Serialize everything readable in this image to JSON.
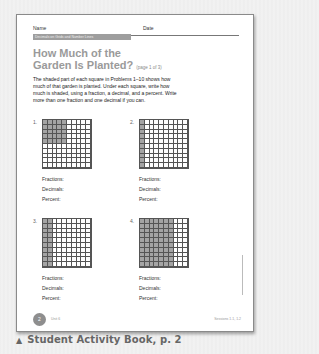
{
  "worksheet": {
    "name_label": "Name",
    "date_label": "Date",
    "banner": "Decimals on Grids and Number Lines",
    "title_line1": "How Much of the",
    "title_line2": "Garden Is Planted?",
    "page_indicator": "(page 1 of 3)",
    "instructions": "The shaded part of each square in Problems 1–10 shows how much of that garden is planted. Under each square, write how much is shaded, using a fraction, a decimal, and a percent. Write more than one fraction and one decimal if you can.",
    "problems": [
      {
        "number": "1.",
        "shading": "5x5 block top-left",
        "shaded_cells": 25,
        "labels": [
          "Fractions:",
          "Decimals:",
          "Percent:"
        ]
      },
      {
        "number": "2.",
        "shading": "first column",
        "shaded_cells": 10,
        "labels": [
          "Fractions:",
          "Decimals:",
          "Percent:"
        ]
      },
      {
        "number": "3.",
        "shading": "first two columns",
        "shaded_cells": 20,
        "labels": [
          "Fractions:",
          "Decimals:",
          "Percent:"
        ]
      },
      {
        "number": "4.",
        "shading": "first seven columns",
        "shaded_cells": 70,
        "labels": [
          "Fractions:",
          "Decimals:",
          "Percent:"
        ]
      }
    ],
    "footer": {
      "page_number": "2",
      "unit": "Unit 6",
      "sessions": "Sessions 1.1, 1.2",
      "copyright": "© Pearson Education 4"
    }
  },
  "caption": {
    "icon": "triangle-up-icon",
    "text": "Student Activity Book, p. 2"
  },
  "colors": {
    "shaded": "#a4a4a4",
    "title": "#9a9a9a",
    "banner": "#9e9e9e"
  }
}
